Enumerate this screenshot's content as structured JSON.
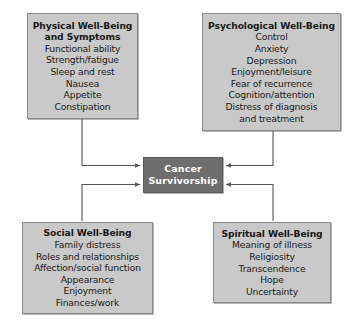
{
  "diagram": {
    "colors": {
      "node_fill": "#c9c9c9",
      "node_border": "#8a8a8a",
      "center_fill": "#6e6e6e",
      "center_text": "#ffffff",
      "connector": "#555555",
      "background": "#ffffff"
    },
    "center": {
      "label": "Cancer\nSurvivorship"
    },
    "nodes": [
      {
        "id": "physical",
        "title": "Physical Well-Being\nand Symptoms",
        "items": [
          "Functional ability",
          "Strength/fatigue",
          "Sleep and rest",
          "Nausea",
          "Appetite",
          "Constipation"
        ]
      },
      {
        "id": "psychological",
        "title": "Psychological Well-Being",
        "items": [
          "Control",
          "Anxiety",
          "Depression",
          "Enjoyment/leisure",
          "Fear of recurrence",
          "Cognition/attention",
          "Distress of diagnosis",
          "and treatment"
        ]
      },
      {
        "id": "social",
        "title": "Social Well-Being",
        "items": [
          "Family distress",
          "Roles and relationships",
          "Affection/social function",
          "Appearance",
          "Enjoyment",
          "Finances/work"
        ]
      },
      {
        "id": "spiritual",
        "title": "Spiritual Well-Being",
        "items": [
          "Meaning of illness",
          "Religiosity",
          "Transcendence",
          "Hope",
          "Uncertainty"
        ]
      }
    ],
    "connectors": [
      {
        "from": "physical",
        "to": "center",
        "direction": "into-center"
      },
      {
        "from": "psychological",
        "to": "center",
        "direction": "into-center"
      },
      {
        "from": "social",
        "to": "center",
        "direction": "into-center"
      },
      {
        "from": "spiritual",
        "to": "center",
        "direction": "into-center"
      }
    ]
  }
}
